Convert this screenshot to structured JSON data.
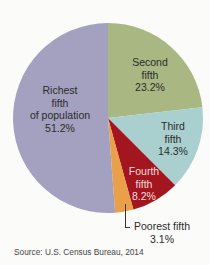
{
  "chart_data": {
    "type": "pie",
    "title": "",
    "source": "Source: U.S. Census Bureau, 2014",
    "start_angle_deg": 0,
    "direction": "clockwise",
    "slices": [
      {
        "name": "Second fifth",
        "value": 23.2,
        "label_lines": [
          "Second",
          "fifth",
          "23.2%"
        ],
        "color": "#a9b782"
      },
      {
        "name": "Third fifth",
        "value": 14.3,
        "label_lines": [
          "Third",
          "fifth",
          "14.3%"
        ],
        "color": "#a9cfcf"
      },
      {
        "name": "Fourth fifth",
        "value": 8.2,
        "label_lines": [
          "Fourth",
          "fifth",
          "8.2%"
        ],
        "color": "#a3151f"
      },
      {
        "name": "Poorest fifth",
        "value": 3.1,
        "label_lines": [
          "Poorest fifth",
          "3.1%"
        ],
        "color": "#eaa048"
      },
      {
        "name": "Richest fifth of population",
        "value": 51.2,
        "label_lines": [
          "Richest",
          "fifth",
          "of population",
          "51.2%"
        ],
        "color": "#a3a0c0"
      }
    ]
  }
}
